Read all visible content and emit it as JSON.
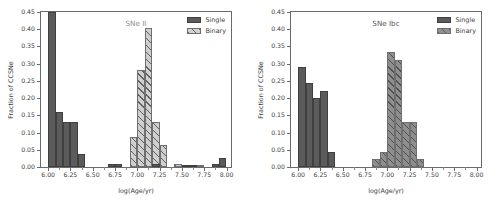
{
  "figure": {
    "width": 500,
    "height": 209,
    "background": "#ffffff",
    "colors": {
      "single": "#5b5b5b",
      "binary_fill": "#cfcfcf",
      "binary_hatch": "#5a5a5a",
      "axis": "#6a6a6a",
      "title_text": "#8d8d8d",
      "tick_text": "#404040"
    }
  },
  "panels": [
    {
      "id": "left",
      "title": "SNe II",
      "xlabel": "log(Age/yr)",
      "ylabel": "Fraction of CCSNe",
      "legend": {
        "position": "upper right",
        "entries": [
          "Single",
          "Binary"
        ]
      }
    },
    {
      "id": "right",
      "title": "SNe Ibc",
      "xlabel": "log(Age/yr)",
      "ylabel": "Fraction of CCSNe",
      "legend": {
        "position": "upper right",
        "entries": [
          "Single",
          "Binary"
        ]
      }
    }
  ],
  "axis": {
    "yticks": [
      "0.00",
      "0.05",
      "0.10",
      "0.15",
      "0.20",
      "0.25",
      "0.30",
      "0.35",
      "0.40",
      "0.45"
    ],
    "ytick_values": [
      0.0,
      0.05,
      0.1,
      0.15,
      0.2,
      0.25,
      0.3,
      0.35,
      0.4,
      0.45
    ],
    "xticks": [
      "6.00",
      "6.25",
      "6.50",
      "6.75",
      "7.00",
      "7.25",
      "7.50",
      "7.75",
      "8.00"
    ],
    "xtick_values": [
      6.0,
      6.25,
      6.5,
      6.75,
      7.0,
      7.25,
      7.5,
      7.75,
      8.0
    ],
    "xlim": [
      5.92,
      8.05
    ],
    "ylim": [
      0.0,
      0.45
    ]
  },
  "chart_data": [
    {
      "type": "bar",
      "id": "sne-ii",
      "title": "SNe II",
      "xlabel": "log(Age/yr)",
      "ylabel": "Fraction of CCSNe",
      "xlim": [
        5.92,
        8.05
      ],
      "ylim": [
        0.0,
        0.45
      ],
      "grid": false,
      "legend_position": "upper right",
      "bin_width": 0.083,
      "series": [
        {
          "name": "Single",
          "style": "solid",
          "bins_left": [
            6.0,
            6.083,
            6.166,
            6.25,
            6.333,
            6.666,
            6.75,
            7.166,
            7.5,
            7.583,
            7.833,
            7.916
          ],
          "values": [
            0.47,
            0.16,
            0.131,
            0.131,
            0.038,
            0.008,
            0.008,
            0.008,
            0.006,
            0.006,
            0.008,
            0.027
          ]
        },
        {
          "name": "Binary",
          "style": "hatched",
          "bins_left": [
            6.916,
            7.0,
            7.083,
            7.166,
            7.25,
            7.416,
            7.583,
            7.666
          ],
          "values": [
            0.086,
            0.283,
            0.405,
            0.131,
            0.065,
            0.008,
            0.005,
            0.005
          ]
        }
      ]
    },
    {
      "type": "bar",
      "id": "sne-ibc",
      "title": "SNe Ibc",
      "xlabel": "log(Age/yr)",
      "ylabel": "Fraction of CCSNe",
      "xlim": [
        5.92,
        8.05
      ],
      "ylim": [
        0.0,
        0.45
      ],
      "grid": false,
      "legend_position": "upper right",
      "bin_width": 0.083,
      "series": [
        {
          "name": "Single",
          "style": "solid",
          "bins_left": [
            6.0,
            6.083,
            6.166,
            6.25,
            6.333
          ],
          "values": [
            0.289,
            0.245,
            0.201,
            0.222,
            0.044
          ]
        },
        {
          "name": "Binary",
          "style": "hatched",
          "bins_left": [
            6.833,
            6.916,
            7.0,
            7.083,
            7.166,
            7.25,
            7.333,
            7.416
          ],
          "values": [
            0.022,
            0.044,
            0.334,
            0.31,
            0.132,
            0.132,
            0.022,
            0.0
          ]
        }
      ]
    }
  ]
}
